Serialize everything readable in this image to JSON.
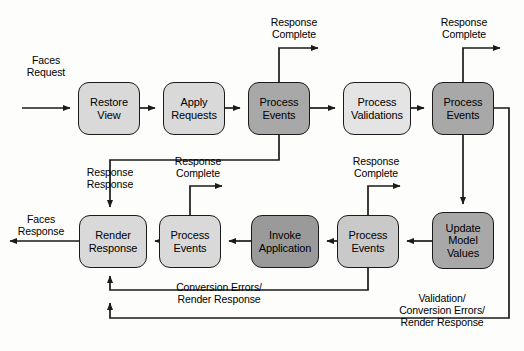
{
  "diagram": {
    "canvas": {
      "width": 524,
      "height": 351
    },
    "colors": {
      "stroke": "#1a1a1a",
      "background": "#fdfdfb",
      "fill_light": "#d9d9d9",
      "fill_lighter": "#e4e4e4",
      "fill_mid": "#c9c9c9",
      "fill_dark": "#a8a8a8",
      "fill_darker": "#9a9a9a"
    },
    "nodes": [
      {
        "id": "restore-view",
        "label": "Restore\nView",
        "shade": "fill-light",
        "x": 78,
        "y": 82,
        "w": 62,
        "h": 53
      },
      {
        "id": "apply-requests",
        "label": "Apply\nRequests",
        "shade": "fill-light",
        "x": 163,
        "y": 82,
        "w": 62,
        "h": 53
      },
      {
        "id": "process-events-1",
        "label": "Process\nEvents",
        "shade": "fill-dark",
        "x": 248,
        "y": 82,
        "w": 62,
        "h": 53
      },
      {
        "id": "process-validations",
        "label": "Process\nValidations",
        "shade": "fill-lighter",
        "x": 343,
        "y": 82,
        "w": 68,
        "h": 53
      },
      {
        "id": "process-events-2",
        "label": "Process\nEvents",
        "shade": "fill-dark",
        "x": 432,
        "y": 82,
        "w": 62,
        "h": 53
      },
      {
        "id": "update-model-values",
        "label": "Update\nModel\nValues",
        "shade": "fill-dark",
        "x": 432,
        "y": 212,
        "w": 62,
        "h": 57
      },
      {
        "id": "process-events-3",
        "label": "Process\nEvents",
        "shade": "fill-mid",
        "x": 337,
        "y": 215,
        "w": 62,
        "h": 53
      },
      {
        "id": "invoke-application",
        "label": "Invoke\nApplication",
        "shade": "fill-darker",
        "x": 251,
        "y": 215,
        "w": 68,
        "h": 53
      },
      {
        "id": "process-events-4",
        "label": "Process\nEvents",
        "shade": "fill-light",
        "x": 159,
        "y": 215,
        "w": 62,
        "h": 53
      },
      {
        "id": "render-response",
        "label": "Render\nResponse",
        "shade": "fill-light",
        "x": 79,
        "y": 215,
        "w": 68,
        "h": 53
      }
    ],
    "edge_labels": [
      {
        "id": "faces-request",
        "text": "Faces\nRequest",
        "x": 14,
        "y": 54,
        "w": 64,
        "align": "center"
      },
      {
        "id": "response-complete-1",
        "text": "Response\nComplete",
        "x": 258,
        "y": 16,
        "w": 72,
        "align": "center"
      },
      {
        "id": "response-complete-2",
        "text": "Response\nComplete",
        "x": 428,
        "y": 16,
        "w": 72,
        "align": "center"
      },
      {
        "id": "response-response",
        "text": "Response\nResponse",
        "x": 72,
        "y": 166,
        "w": 76,
        "align": "center"
      },
      {
        "id": "response-complete-3",
        "text": "Response\nComplete",
        "x": 162,
        "y": 155,
        "w": 72,
        "align": "center"
      },
      {
        "id": "response-complete-4",
        "text": "Response\nComplete",
        "x": 340,
        "y": 155,
        "w": 72,
        "align": "center"
      },
      {
        "id": "faces-response",
        "text": "Faces\nResponse",
        "x": 5,
        "y": 213,
        "w": 72,
        "align": "center"
      },
      {
        "id": "conversion-errors",
        "text": "Conversion Errors/\nRender Response",
        "x": 155,
        "y": 281,
        "w": 128,
        "align": "center"
      },
      {
        "id": "validation-errors",
        "text": "Validation/\nConversion Errors/\nRender Response",
        "x": 378,
        "y": 292,
        "w": 128,
        "align": "center"
      }
    ]
  }
}
